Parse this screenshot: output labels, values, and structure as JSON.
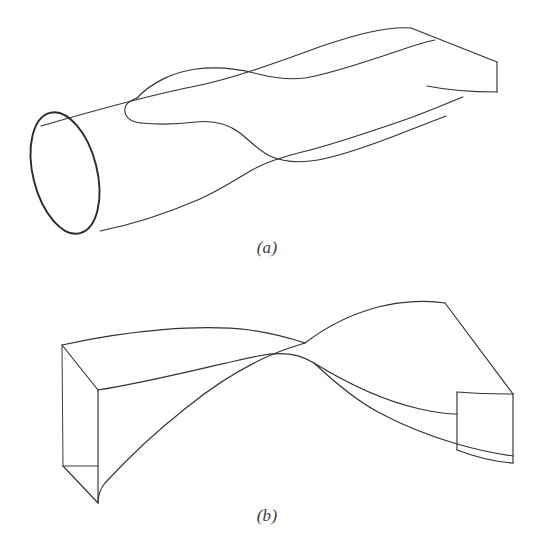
{
  "figure": {
    "background_color": "#ffffff",
    "ink_color": "#333333",
    "ink_color_heavy": "#2b2b2b",
    "panels": [
      {
        "id": "a",
        "caption": "(a)",
        "description": "Solid transitioning from a circular cylindrical cross-section on the left to a flat rectangular slab on the right",
        "shape_kind": "cylinder-to-rectangle-transition"
      },
      {
        "id": "b",
        "caption": "(b)",
        "description": "Twisted rectangular slab whose end cross-sections are rotated relative to one another, producing a self-crossing silhouette",
        "shape_kind": "twisted-rectangular-slab"
      }
    ]
  },
  "geometry": {
    "panel_a": {
      "end_cap_ellipse": {
        "cx": 65,
        "cy": 173,
        "rx": 32,
        "ry": 62,
        "rotation_deg": -14
      },
      "top_silhouette": "M 40,130 C 120,104 170,92 205,86",
      "slab_top_apex": [
        411,
        28
      ],
      "slab_right_corner": [
        497,
        62
      ],
      "slab_right_bottom": [
        497,
        92
      ],
      "tongue_curve_label": "blend-surface-silhouette"
    },
    "panel_b": {
      "left_face_corners": [
        [
          62,
          67
        ],
        [
          98,
          112
        ],
        [
          98,
          225
        ],
        [
          63,
          188
        ]
      ],
      "right_face_corners": [
        [
          457,
          114
        ],
        [
          513,
          116
        ],
        [
          513,
          185
        ],
        [
          457,
          172
        ]
      ],
      "twist_crossing": [
        288,
        66
      ]
    }
  }
}
